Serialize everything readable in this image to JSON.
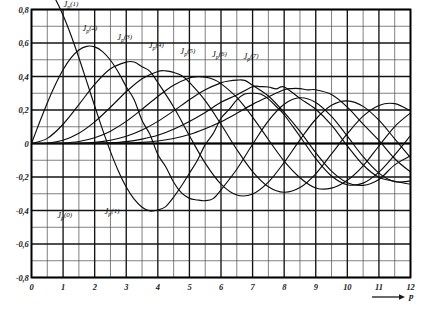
{
  "chart_data": {
    "type": "line",
    "title": "",
    "subtitle": "",
    "xlabel": "p",
    "ylabel": "",
    "xlim": [
      0,
      12
    ],
    "ylim": [
      -0.8,
      0.8
    ],
    "grid": true,
    "grid_major_x": 1,
    "grid_major_y": 0.2,
    "grid_minor_x": 0.5,
    "grid_minor_y": 0.1,
    "legend_position": "inline-labels",
    "x_ticks": [
      "0",
      "1",
      "2",
      "3",
      "4",
      "5",
      "6",
      "7",
      "8",
      "9",
      "10",
      "11",
      "12"
    ],
    "x_tick_values": [
      0,
      1,
      2,
      3,
      4,
      5,
      6,
      7,
      8,
      9,
      10,
      11,
      12
    ],
    "y_ticks": [
      "0,8",
      "0,6",
      "0,4",
      "0,2",
      "0",
      "-0,2",
      "-0,4",
      "-0,6",
      "-0,8"
    ],
    "y_tick_values": [
      0.8,
      0.6,
      0.4,
      0.2,
      0,
      -0.2,
      -0.4,
      -0.6,
      -0.8
    ],
    "axis_arrow_label": "p",
    "series": [
      {
        "name": "J_p(0)",
        "label_base": "J",
        "label_sub": "p",
        "label_arg": "(0)",
        "label_x": 1.05,
        "label_y": -0.46,
        "x": [
          0,
          0.25,
          0.5,
          0.75,
          1,
          1.25,
          1.5,
          1.75,
          2,
          2.25,
          2.5,
          2.75,
          3,
          3.25,
          3.5,
          3.75,
          4,
          4.25,
          4.5,
          4.75,
          5,
          5.25,
          5.5,
          5.75,
          6,
          6.25,
          6.5,
          6.75,
          7,
          7.25,
          7.5,
          7.75,
          8,
          8.5,
          9,
          9.5,
          10,
          10.5,
          11,
          11.5,
          12
        ],
        "y": [
          1.0,
          0.9844,
          0.9385,
          0.8642,
          0.7652,
          0.6459,
          0.5118,
          0.369,
          0.2239,
          0.0827,
          -0.0484,
          -0.1641,
          -0.2601,
          -0.3325,
          -0.3801,
          -0.4026,
          -0.3971,
          -0.3766,
          -0.3205,
          -0.2523,
          -0.1776,
          -0.1018,
          -0.0068,
          0.0587,
          0.1506,
          0.2017,
          0.2601,
          0.2951,
          0.3001,
          0.2951,
          0.2663,
          0.2207,
          0.1717,
          0.0419,
          -0.0903,
          -0.1939,
          -0.2459,
          -0.2366,
          -0.1712,
          -0.0677,
          0.0477
        ]
      },
      {
        "name": "J_p(1)",
        "label_base": "J",
        "label_sub": "p",
        "label_arg": "(1)",
        "label_x": 1.25,
        "label_y": 0.8,
        "label2_x": 2.55,
        "label2_y": -0.44,
        "x": [
          0,
          0.25,
          0.5,
          0.75,
          1,
          1.25,
          1.5,
          1.75,
          2,
          2.25,
          2.5,
          2.75,
          3,
          3.25,
          3.5,
          3.75,
          4,
          4.25,
          4.5,
          4.75,
          5,
          5.25,
          5.5,
          5.75,
          6,
          6.5,
          7,
          7.5,
          8,
          8.5,
          9,
          9.5,
          10,
          10.5,
          11,
          11.5,
          12
        ],
        "y": [
          0,
          0.124,
          0.2423,
          0.3492,
          0.4401,
          0.5106,
          0.5579,
          0.5802,
          0.5767,
          0.5484,
          0.4971,
          0.4256,
          0.3391,
          0.2613,
          0.1374,
          0.0538,
          -0.066,
          -0.1386,
          -0.2311,
          -0.2951,
          -0.3276,
          -0.3371,
          -0.3414,
          -0.329,
          -0.2767,
          -0.1538,
          -0.0047,
          0.1352,
          0.2346,
          0.2731,
          0.2453,
          0.1613,
          0.0435,
          -0.0789,
          -0.1768,
          -0.2284,
          -0.2234
        ]
      },
      {
        "name": "J_p(2)",
        "label_base": "J",
        "label_sub": "p",
        "label_arg": "(2)",
        "label_x": 1.85,
        "label_y": 0.655,
        "x": [
          0,
          0.5,
          1,
          1.5,
          2,
          2.5,
          3,
          3.25,
          3.5,
          3.75,
          4,
          4.5,
          5,
          5.5,
          6,
          6.5,
          7,
          7.5,
          8,
          8.5,
          9,
          9.5,
          10,
          10.5,
          11,
          11.5,
          12
        ],
        "y": [
          0,
          0.0306,
          0.1149,
          0.2321,
          0.3528,
          0.4461,
          0.4861,
          0.4862,
          0.4586,
          0.431,
          0.3641,
          0.2178,
          0.0466,
          -0.1173,
          -0.2429,
          -0.3074,
          -0.3014,
          -0.2303,
          -0.113,
          0.0218,
          0.1448,
          0.2279,
          0.2546,
          0.2216,
          0.139,
          0.0279,
          -0.0849
        ]
      },
      {
        "name": "J_p(3)",
        "label_base": "J",
        "label_sub": "p",
        "label_arg": "(3)",
        "label_x": 2.95,
        "label_y": 0.6,
        "x": [
          0,
          0.5,
          1,
          1.5,
          2,
          2.5,
          3,
          3.5,
          4,
          4.25,
          4.5,
          4.75,
          5,
          5.5,
          6,
          6.5,
          7,
          7.5,
          8,
          8.5,
          9,
          9.5,
          10,
          10.5,
          11,
          11.5,
          12
        ],
        "y": [
          0,
          0.0026,
          0.0196,
          0.061,
          0.1289,
          0.2166,
          0.3091,
          0.3868,
          0.4302,
          0.4333,
          0.4247,
          0.4056,
          0.3648,
          0.2561,
          0.1148,
          -0.0357,
          -0.1676,
          -0.2581,
          -0.2911,
          -0.2633,
          -0.1809,
          -0.062,
          0.0583,
          0.1633,
          0.2273,
          0.2379,
          0.1951
        ]
      },
      {
        "name": "J_p(4)",
        "label_base": "J",
        "label_sub": "p",
        "label_arg": "(4)",
        "label_x": 3.95,
        "label_y": 0.555,
        "x": [
          0,
          0.5,
          1,
          1.5,
          2,
          2.5,
          3,
          3.5,
          4,
          4.5,
          5,
          5.25,
          5.5,
          5.75,
          6,
          6.5,
          7,
          7.5,
          8,
          8.5,
          9,
          9.5,
          10,
          10.5,
          11,
          11.5,
          12
        ],
        "y": [
          0,
          0.0002,
          0.0025,
          0.0118,
          0.034,
          0.0738,
          0.132,
          0.2044,
          0.2811,
          0.3484,
          0.3912,
          0.3983,
          0.396,
          0.3835,
          0.3576,
          0.2748,
          0.1578,
          0.0238,
          -0.1054,
          -0.2041,
          -0.2655,
          -0.2666,
          -0.2196,
          -0.1331,
          -0.015,
          0.1013,
          0.1825
        ]
      },
      {
        "name": "J_p(5)",
        "label_base": "J",
        "label_sub": "p",
        "label_arg": "(5)",
        "label_x": 4.95,
        "label_y": 0.515,
        "x": [
          0,
          1,
          1.5,
          2,
          2.5,
          3,
          3.5,
          4,
          4.5,
          5,
          5.5,
          6,
          6.25,
          6.5,
          6.75,
          7,
          7.5,
          8,
          8.5,
          9,
          9.5,
          10,
          10.5,
          11,
          11.5,
          12
        ],
        "y": [
          0,
          0.0002,
          0.0018,
          0.007,
          0.0195,
          0.043,
          0.0804,
          0.1321,
          0.1947,
          0.2611,
          0.3209,
          0.3621,
          0.3731,
          0.3783,
          0.3767,
          0.3479,
          0.2835,
          0.1858,
          0.0725,
          -0.055,
          -0.165,
          -0.2341,
          -0.2496,
          -0.2143,
          -0.1274,
          -0.0735
        ]
      },
      {
        "name": "J_p(6)",
        "label_base": "J",
        "label_sub": "p",
        "label_arg": "(6)",
        "label_x": 5.95,
        "label_y": 0.5,
        "x": [
          0,
          1,
          2,
          2.5,
          3,
          3.5,
          4,
          4.5,
          5,
          5.5,
          6,
          6.5,
          7,
          7.25,
          7.5,
          7.75,
          8,
          8.5,
          9,
          9.5,
          10,
          10.5,
          11,
          11.5,
          12
        ],
        "y": [
          0,
          2e-05,
          0.0012,
          0.004,
          0.0114,
          0.0264,
          0.0491,
          0.0851,
          0.131,
          0.1847,
          0.2458,
          0.29,
          0.3392,
          0.3392,
          0.3376,
          0.3258,
          0.3376,
          0.2693,
          0.2043,
          0.1098,
          -0.0145,
          -0.1285,
          -0.2016,
          -0.2254,
          -0.2437
        ]
      },
      {
        "name": "J_p(7)",
        "label_base": "J",
        "label_sub": "p",
        "label_arg": "(7)",
        "label_x": 6.95,
        "label_y": 0.485,
        "x": [
          0,
          1,
          2,
          3,
          3.5,
          4,
          4.5,
          5,
          5.5,
          6,
          6.5,
          7,
          7.5,
          8,
          8.25,
          8.5,
          8.75,
          9,
          9.5,
          10,
          10.5,
          11,
          11.5,
          12
        ],
        "y": [
          0,
          0.0,
          0.0002,
          0.0026,
          0.007,
          0.0152,
          0.0298,
          0.0534,
          0.0879,
          0.1296,
          0.1802,
          0.2336,
          0.279,
          0.3206,
          0.328,
          0.3275,
          0.32,
          0.3206,
          0.2919,
          0.2167,
          0.1156,
          0.0184,
          -0.091,
          -0.1703
        ]
      }
    ]
  }
}
